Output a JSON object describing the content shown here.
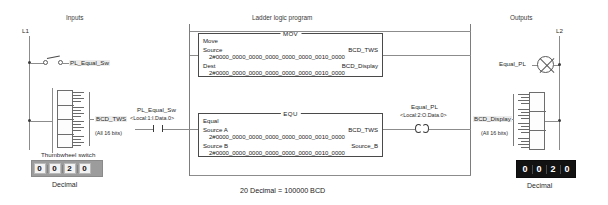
{
  "headers": {
    "inputs": "Inputs",
    "program": "Ladder logic program",
    "outputs": "Outputs"
  },
  "rails": {
    "left_label": "L1",
    "right_label": "L2"
  },
  "field_inputs": {
    "switch": {
      "label": "PL_Equal_Sw",
      "symbol": "normally-open-switch"
    },
    "thumbwheel": {
      "tag": "BCD_TWS",
      "bits_note": "(All 16 bits)",
      "caption": "Thumbwheel switch",
      "display_digits": [
        "0",
        "0",
        "2",
        "0"
      ],
      "display_caption": "Decimal"
    }
  },
  "program": {
    "rung1": {
      "instruction": {
        "mnemonic": "MOV",
        "name": "Move",
        "operands": [
          {
            "label": "Source",
            "tag": "BCD_TWS",
            "value": "2#0000_0000_0000_0000_0000_0000_0010_0000"
          },
          {
            "label": "Dest",
            "tag": "BCD_Display",
            "value": "2#0000_0000_0000_0000_0000_0000_0010_0000"
          }
        ]
      }
    },
    "rung2": {
      "contact": {
        "tag": "PL_Equal_Sw",
        "address": "<Local:1:I.Data.0>",
        "type": "examine-if-closed"
      },
      "instruction": {
        "mnemonic": "EQU",
        "name": "Equal",
        "operands": [
          {
            "label": "Source A",
            "tag": "BCD_TWS",
            "value": "2#0000_0000_0000_0000_0000_0000_0010_0000"
          },
          {
            "label": "Source B",
            "tag": "Source_B",
            "value": "2#0000_0000_0000_0000_0000_0000_0010_0000"
          }
        ]
      },
      "coil": {
        "tag": "Equal_PL",
        "address": "<Local:2:O.Data.0>",
        "type": "output-energize"
      }
    }
  },
  "field_outputs": {
    "lamp": {
      "label": "Equal_PL",
      "symbol": "pilot-light"
    },
    "display": {
      "tag": "BCD_Display",
      "bits_note": "(All 16 bits)",
      "digits": [
        "0",
        "0",
        "2",
        "0"
      ],
      "caption": "Decimal"
    }
  },
  "caption": "20 Decimal = 100000 BCD",
  "colors": {
    "line": "#8c8c8c",
    "ink": "#222222",
    "display_dark_bg": "#121212",
    "display_light_bg": "#9c9c9c"
  }
}
